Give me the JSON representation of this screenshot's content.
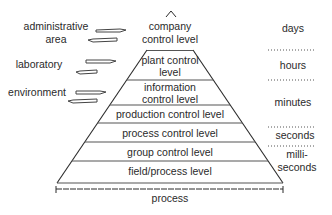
{
  "diagram": {
    "apex_symbol": "^",
    "levels": [
      {
        "lines": [
          "company",
          "control level"
        ]
      },
      {
        "lines": [
          "plant control",
          "level"
        ]
      },
      {
        "lines": [
          "information",
          "control level"
        ]
      },
      {
        "lines": [
          "production control level"
        ]
      },
      {
        "lines": [
          "process control level"
        ]
      },
      {
        "lines": [
          "group control level"
        ]
      },
      {
        "lines": [
          "field/process level"
        ]
      }
    ],
    "base_label": "process",
    "inputs": [
      {
        "lines": [
          "administrative",
          "area"
        ]
      },
      {
        "lines": [
          "laboratory"
        ]
      },
      {
        "lines": [
          "environment"
        ]
      }
    ],
    "time_scales": [
      {
        "lines": [
          "days"
        ]
      },
      {
        "lines": [
          "hours"
        ]
      },
      {
        "lines": [
          "minutes"
        ]
      },
      {
        "lines": [
          "seconds"
        ]
      },
      {
        "lines": [
          "milli-",
          "seconds"
        ]
      }
    ],
    "colors": {
      "line": "#2a2a2a",
      "background": "#ffffff"
    }
  }
}
